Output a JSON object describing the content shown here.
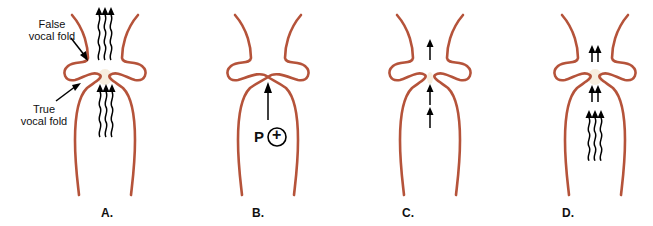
{
  "figure": {
    "panels": [
      {
        "id": "A",
        "label": "A.",
        "airflow": "wavy streams through open glottis"
      },
      {
        "id": "B",
        "label": "B.",
        "airflow": "subglottal pressure buildup, glottis closed"
      },
      {
        "id": "C",
        "label": "C.",
        "airflow": "straight arrows through narrow opening"
      },
      {
        "id": "D",
        "label": "D.",
        "airflow": "straight and wavy arrows, glottis open"
      }
    ],
    "annotations": {
      "false_fold": "False\nvocal fold",
      "false_fold_l1": "False",
      "false_fold_l2": "vocal fold",
      "true_fold_l1": "True",
      "true_fold_l2": "vocal fold",
      "pressure_symbol": "P",
      "pressure_sign": "+"
    },
    "colors": {
      "wall": "#b5533a",
      "glottis": "#f7eedf",
      "arrow": "#000000"
    }
  }
}
